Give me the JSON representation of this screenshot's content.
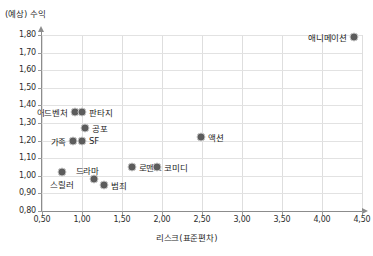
{
  "chart_data": {
    "type": "scatter",
    "title": "",
    "ylabel": "(예상) 수익",
    "xlabel": "리스크(표준편차)",
    "xlim": [
      0.5,
      4.5
    ],
    "ylim": [
      0.8,
      1.8
    ],
    "xticks": [
      "0,50",
      "1,00",
      "1,50",
      "2,00",
      "2,50",
      "3,00",
      "3,50",
      "4,00",
      "4,50"
    ],
    "xtick_values": [
      0.5,
      1.0,
      1.5,
      2.0,
      2.5,
      3.0,
      3.5,
      4.0,
      4.5
    ],
    "yticks": [
      "0,80",
      "0,90",
      "1,00",
      "1,10",
      "1,20",
      "1,30",
      "1,40",
      "1,50",
      "1,60",
      "1,70",
      "1,80"
    ],
    "ytick_values": [
      0.8,
      0.9,
      1.0,
      1.1,
      1.2,
      1.3,
      1.4,
      1.5,
      1.6,
      1.7,
      1.8
    ],
    "grid": true,
    "legend": "none",
    "marker_color": "#5c5c5c",
    "marker_halo_color": "#c9c9c9",
    "points": [
      {
        "label": "애니메이션",
        "x": 4.4,
        "y": 1.79,
        "label_pos": "left"
      },
      {
        "label": "어드벤처",
        "x": 0.91,
        "y": 1.36,
        "label_pos": "left"
      },
      {
        "label": "판타지",
        "x": 1.0,
        "y": 1.36,
        "label_pos": "right"
      },
      {
        "label": "공포",
        "x": 1.04,
        "y": 1.27,
        "label_pos": "right"
      },
      {
        "label": "가족",
        "x": 0.89,
        "y": 1.2,
        "label_pos": "left"
      },
      {
        "label": "SF",
        "x": 1.0,
        "y": 1.2,
        "label_pos": "right"
      },
      {
        "label": "액션",
        "x": 2.49,
        "y": 1.22,
        "label_pos": "right"
      },
      {
        "label": "로맨스",
        "x": 1.62,
        "y": 1.05,
        "label_pos": "right"
      },
      {
        "label": "코미디",
        "x": 1.94,
        "y": 1.05,
        "label_pos": "right"
      },
      {
        "label": "드라마",
        "x": 1.15,
        "y": 0.98,
        "label_pos": "topleft"
      },
      {
        "label": "범죄",
        "x": 1.28,
        "y": 0.95,
        "label_pos": "right"
      },
      {
        "label": "스릴러",
        "x": 0.75,
        "y": 1.02,
        "label_pos": "below"
      }
    ]
  }
}
